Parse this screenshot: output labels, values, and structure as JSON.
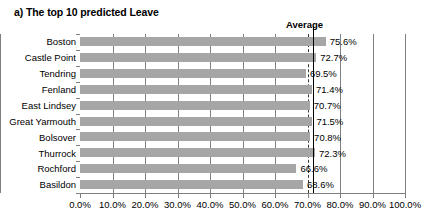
{
  "title": "a) The top 10 predicted Leave",
  "annotation": {
    "average_label": "Average",
    "average_value": 71.0
  },
  "axis": {
    "x_ticks": [
      "0.0%",
      "10.0%",
      "20.0%",
      "30.0%",
      "40.0%",
      "50.0%",
      "60.0%",
      "70.0%",
      "80.0%",
      "90.0%",
      "100.0%"
    ]
  },
  "colors": {
    "bar": "#a6a6a6",
    "gridline": "#808080",
    "average_line": "#000000",
    "axis": "#7f7f7f",
    "text": "#000000"
  },
  "chart_data": {
    "type": "bar",
    "orientation": "horizontal",
    "title": "a) The top 10 predicted Leave",
    "xlabel": "",
    "ylabel": "",
    "xlim": [
      0,
      100
    ],
    "xticks": [
      0,
      10,
      20,
      30,
      40,
      50,
      60,
      70,
      80,
      90,
      100
    ],
    "xtick_labels": [
      "0.0%",
      "10.0%",
      "20.0%",
      "30.0%",
      "40.0%",
      "50.0%",
      "60.0%",
      "70.0%",
      "80.0%",
      "90.0%",
      "100.0%"
    ],
    "grid": true,
    "legend": false,
    "categories": [
      "Boston",
      "Castle Point",
      "Tendring",
      "Fenland",
      "East Lindsey",
      "Great Yarmouth",
      "Bolsover",
      "Thurrock",
      "Rochford",
      "Basildon"
    ],
    "values": [
      75.6,
      72.7,
      69.5,
      71.4,
      70.7,
      71.5,
      70.8,
      72.3,
      66.6,
      68.6
    ],
    "data_labels": [
      "75.6%",
      "72.7%",
      "69.5%",
      "71.4%",
      "70.7%",
      "71.5%",
      "70.8%",
      "72.3%",
      "66.6%",
      "68.6%"
    ],
    "annotations": [
      {
        "type": "vline",
        "label": "Average",
        "value": 71.0
      }
    ]
  }
}
